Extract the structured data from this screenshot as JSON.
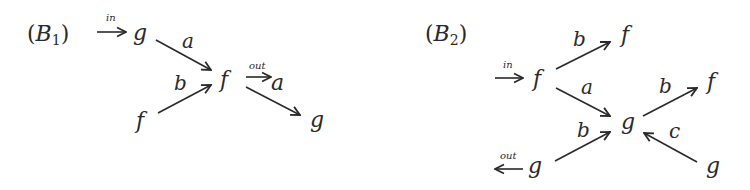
{
  "diagrams": [
    {
      "id": "B1",
      "title": {
        "open": "(",
        "letter": "B",
        "subscript": "1",
        "close": ")"
      },
      "input_label": "in",
      "output_label": "out",
      "nodes": [
        {
          "id": "g_in",
          "label": "g"
        },
        {
          "id": "f_left",
          "label": "f"
        },
        {
          "id": "f_center",
          "label": "f"
        },
        {
          "id": "a_out",
          "label": "a"
        },
        {
          "id": "g_right",
          "label": "g"
        }
      ],
      "edges": [
        {
          "from": "g_in",
          "to": "f_center",
          "label": "a"
        },
        {
          "from": "f_left",
          "to": "f_center",
          "label": "b"
        },
        {
          "from": "f_center",
          "to": "a_out",
          "label": "out"
        },
        {
          "from": "f_center",
          "to": "g_right",
          "label": ""
        }
      ]
    },
    {
      "id": "B2",
      "title": {
        "open": "(",
        "letter": "B",
        "subscript": "2",
        "close": ")"
      },
      "input_label": "in",
      "output_label": "out",
      "nodes": [
        {
          "id": "f_in",
          "label": "f"
        },
        {
          "id": "f_top",
          "label": "f"
        },
        {
          "id": "g_center",
          "label": "g"
        },
        {
          "id": "f_right",
          "label": "f"
        },
        {
          "id": "g_right",
          "label": "g"
        },
        {
          "id": "g_out",
          "label": "g"
        }
      ],
      "edges": [
        {
          "from": "f_in",
          "to": "f_top",
          "label": "b"
        },
        {
          "from": "f_in",
          "to": "g_center",
          "label": "a"
        },
        {
          "from": "g_center",
          "to": "f_right",
          "label": "b"
        },
        {
          "from": "g_right",
          "to": "g_center",
          "label": "c"
        },
        {
          "from": "g_out",
          "to": "g_center",
          "label": "b"
        }
      ]
    }
  ]
}
